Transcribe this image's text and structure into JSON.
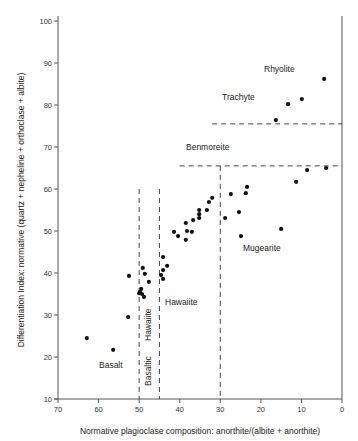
{
  "chart_data": {
    "type": "scatter",
    "title": "",
    "xlabel": "Normative plagioclase composition: anorthite/(albite + anorthite)",
    "ylabel": "Differentiation Index: normative (quartz + nepheline + orthoclase + albite)",
    "xlim": [
      70,
      0
    ],
    "ylim": [
      10,
      100
    ],
    "x_reversed": true,
    "grid": false,
    "legend": null,
    "x_ticks": [
      70,
      60,
      50,
      40,
      30,
      20,
      10,
      0
    ],
    "y_ticks": [
      10,
      20,
      30,
      40,
      50,
      60,
      70,
      80,
      90,
      100
    ],
    "series": [
      {
        "name": "samples",
        "points": [
          [
            4.4,
            86.2
          ],
          [
            9.9,
            81.4
          ],
          [
            13.3,
            80.2
          ],
          [
            16.3,
            76.4
          ],
          [
            3.9,
            65.0
          ],
          [
            8.6,
            64.5
          ],
          [
            11.3,
            61.7
          ],
          [
            23.4,
            60.5
          ],
          [
            23.7,
            59.0
          ],
          [
            27.4,
            58.8
          ],
          [
            25.4,
            54.5
          ],
          [
            28.8,
            53.1
          ],
          [
            15.0,
            50.5
          ],
          [
            24.9,
            48.8
          ],
          [
            32.0,
            57.9
          ],
          [
            32.8,
            56.9
          ],
          [
            33.3,
            55.0
          ],
          [
            35.2,
            55.0
          ],
          [
            35.2,
            54.0
          ],
          [
            35.2,
            53.1
          ],
          [
            36.7,
            52.6
          ],
          [
            38.5,
            51.9
          ],
          [
            38.2,
            50.0
          ],
          [
            37.0,
            49.8
          ],
          [
            38.5,
            47.9
          ],
          [
            41.4,
            49.8
          ],
          [
            40.4,
            48.8
          ],
          [
            44.1,
            43.8
          ],
          [
            43.1,
            41.7
          ],
          [
            44.1,
            40.7
          ],
          [
            44.6,
            39.5
          ],
          [
            44.1,
            38.6
          ],
          [
            49.1,
            41.2
          ],
          [
            48.6,
            39.8
          ],
          [
            47.6,
            37.9
          ],
          [
            52.5,
            39.3
          ],
          [
            49.5,
            36.2
          ],
          [
            49.8,
            35.5
          ],
          [
            50.0,
            35.2
          ],
          [
            49.3,
            35.0
          ],
          [
            48.8,
            34.3
          ],
          [
            52.7,
            29.5
          ],
          [
            62.9,
            24.5
          ],
          [
            56.4,
            21.7
          ]
        ]
      }
    ],
    "boundaries": [
      {
        "orientation": "vertical",
        "x": 50,
        "y_from": 10,
        "y_to": 60,
        "style": "dashed"
      },
      {
        "orientation": "vertical",
        "x": 45,
        "y_from": 10,
        "y_to": 60,
        "style": "dashed"
      },
      {
        "orientation": "vertical",
        "x": 30,
        "y_from": 10,
        "y_to": 65.5,
        "style": "dashed"
      },
      {
        "orientation": "horizontal",
        "y": 65.5,
        "x_from": 40,
        "x_to": 0,
        "style": "dashed"
      },
      {
        "orientation": "horizontal",
        "y": 75.5,
        "x_from": 32,
        "x_to": 0,
        "style": "dashed"
      }
    ],
    "annotations": [
      {
        "text": "Rhyolite",
        "x": 19,
        "y": 88
      },
      {
        "text": "Trachyte",
        "x": 29.5,
        "y": 81
      },
      {
        "text": "Benmoreite",
        "x": 38.5,
        "y": 70
      },
      {
        "text": "Mugearite",
        "x": 24,
        "y": 45
      },
      {
        "text": "Hawaiite",
        "x": 43.5,
        "y": 33.5
      },
      {
        "text": "Hawaiite",
        "x": 47.5,
        "y": 30,
        "rotation": -90
      },
      {
        "text": "Basaltic",
        "x": 48.5,
        "y": 14.5,
        "rotation": -90
      },
      {
        "text": "Basalt",
        "x": 60.5,
        "y": 18
      }
    ]
  },
  "labels": {
    "x_axis_title": "Normative plagioclase composition: anorthite/(albite + anorthite)",
    "y_axis_title": "Differentiation Index: normative (quartz + nepheline + orthoclase + albite)",
    "rhyolite": "Rhyolite",
    "trachyte": "Trachyte",
    "benmoreite": "Benmoreite",
    "mugearite": "Mugearite",
    "hawaiite": "Hawaiite",
    "hawaiite_vertical": "Hawaiite",
    "basaltic": "Basaltic",
    "basalt": "Basalt"
  }
}
